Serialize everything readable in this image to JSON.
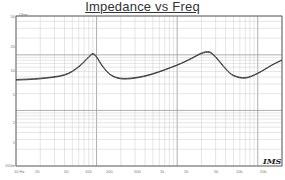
{
  "chart_data": {
    "type": "line",
    "title": "Impedance vs Freq",
    "xlabel": "",
    "ylabel": "Ohm",
    "xscale": "log",
    "yscale": "log",
    "xlim": [
      10,
      20000
    ],
    "ylim": [
      0.1,
      50
    ],
    "x_tick_labels": [
      "10 Hz",
      "20",
      "50",
      "100",
      "200",
      "500",
      "1k",
      "2k",
      "5k",
      "10k",
      "20k"
    ],
    "y_tick_labels": [
      "50",
      "20",
      "10",
      "5",
      "2",
      "1",
      "100m"
    ],
    "grid": true,
    "legend": null,
    "series": [
      {
        "name": "Impedance curve A",
        "x": [
          10,
          20,
          40,
          60,
          80,
          90,
          100,
          120,
          150,
          200,
          300,
          500,
          1000,
          1500,
          2000,
          2500,
          3000,
          4000,
          5000,
          7000,
          10000,
          15000,
          20000
        ],
        "y": [
          3.5,
          3.7,
          4.3,
          6.0,
          9.0,
          10.2,
          9.0,
          6.0,
          4.3,
          3.7,
          3.8,
          4.5,
          6.5,
          8.5,
          10.5,
          11.0,
          9.0,
          5.5,
          4.2,
          3.8,
          4.6,
          6.5,
          8.0
        ]
      },
      {
        "name": "Impedance curve B",
        "x": [
          10,
          20,
          40,
          60,
          80,
          90,
          100,
          120,
          150,
          200,
          300,
          500,
          1000,
          1500,
          2000,
          2500,
          3000,
          4000,
          5000,
          7000,
          10000,
          15000,
          20000
        ],
        "y": [
          3.6,
          3.8,
          4.4,
          6.2,
          9.3,
          10.6,
          9.3,
          6.2,
          4.4,
          3.8,
          3.9,
          4.6,
          6.6,
          8.7,
          10.8,
          11.4,
          9.3,
          5.7,
          4.3,
          3.9,
          4.7,
          6.6,
          8.1
        ]
      }
    ],
    "annotations": [
      "IMS"
    ]
  },
  "header": {
    "title": "Impedance vs Freq"
  },
  "axis": {
    "unit": "Ohm",
    "y": [
      {
        "label": "50",
        "top": 14
      },
      {
        "label": "20",
        "top": 44
      },
      {
        "label": "10",
        "top": 68
      },
      {
        "label": "5",
        "top": 92
      },
      {
        "label": "2",
        "top": 120
      },
      {
        "label": "1",
        "top": 140
      },
      {
        "label": "100m",
        "top": 163
      }
    ],
    "x": [
      {
        "label": "10 Hz",
        "left": 14
      },
      {
        "label": "20",
        "left": 35
      },
      {
        "label": "50",
        "left": 64
      },
      {
        "label": "100",
        "left": 85
      },
      {
        "label": "200",
        "left": 106
      },
      {
        "label": "500",
        "left": 134
      },
      {
        "label": "1k",
        "left": 160
      },
      {
        "label": "2k",
        "left": 184
      },
      {
        "label": "5k",
        "left": 214
      },
      {
        "label": "10k",
        "left": 236
      },
      {
        "label": "20k",
        "left": 260
      },
      {
        "label": "",
        "left": 278
      }
    ]
  },
  "logo": {
    "text": "IMS"
  },
  "colors": {
    "curve": "#333333",
    "grid": "#999999",
    "grid_minor": "#cccccc"
  }
}
